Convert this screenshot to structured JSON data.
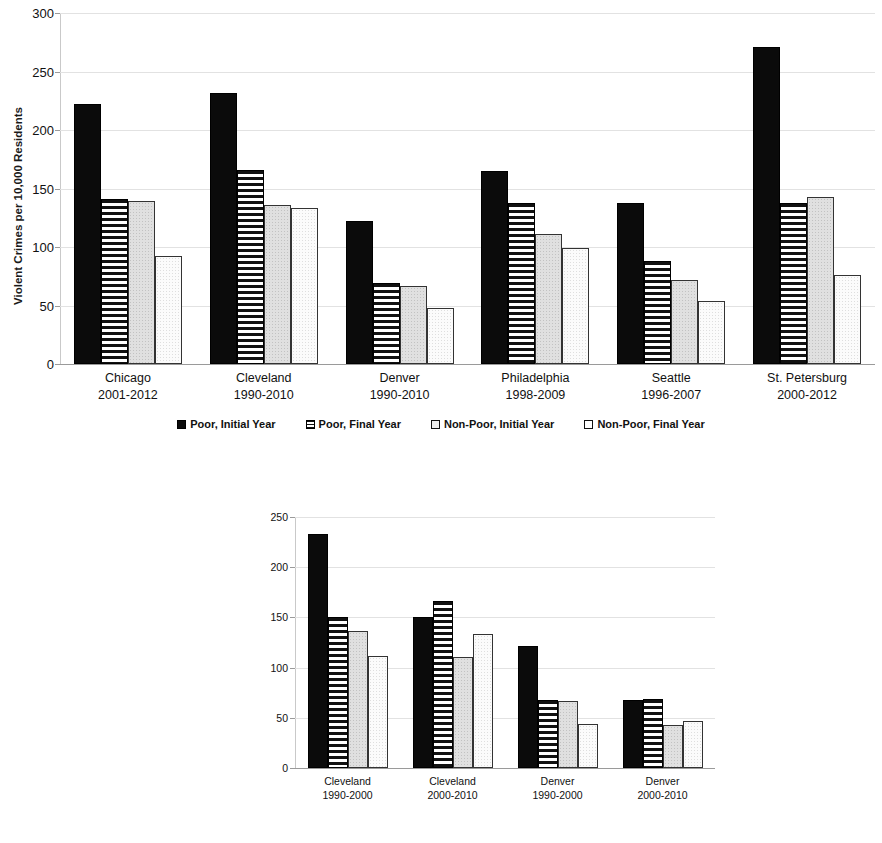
{
  "charts": [
    {
      "id": "top",
      "ylabel": "Violent Crimes per 10,000 Residents",
      "yticks": [
        "0",
        "50",
        "100",
        "150",
        "200",
        "250",
        "300"
      ],
      "categories": [
        {
          "name": "Chicago",
          "period": "2001-2012"
        },
        {
          "name": "Cleveland",
          "period": "1990-2010"
        },
        {
          "name": "Denver",
          "period": "1990-2010"
        },
        {
          "name": "Philadelphia",
          "period": "1998-2009"
        },
        {
          "name": "Seattle",
          "period": "1996-2007"
        },
        {
          "name": "St. Petersburg",
          "period": "2000-2012"
        }
      ],
      "legend": [
        {
          "label": "Poor, Initial Year",
          "swatch": "poor-initial"
        },
        {
          "label": "Poor, Final Year",
          "swatch": "poor-final"
        },
        {
          "label": "Non-Poor, Initial Year",
          "swatch": "nonpoor-initial"
        },
        {
          "label": "Non-Poor, Final Year",
          "swatch": "nonpoor-final"
        }
      ]
    },
    {
      "id": "bottom",
      "ylabel": "Violent Crimes per 10,000 Residents",
      "yticks": [
        "0",
        "50",
        "100",
        "150",
        "200",
        "250"
      ],
      "categories": [
        {
          "name": "Cleveland",
          "period": "1990-2000"
        },
        {
          "name": "Cleveland",
          "period": "2000-2010"
        },
        {
          "name": "Denver",
          "period": "1990-2000"
        },
        {
          "name": "Denver",
          "period": "2000-2010"
        }
      ],
      "legend": [
        {
          "label": "Poor, Initial Year",
          "swatch": "poor-initial"
        },
        {
          "label": "Poor, Final Year",
          "swatch": "poor-final"
        },
        {
          "label": "Non-Poor, Initial Year",
          "swatch": "nonpoor-initial"
        },
        {
          "label": "Non-Poor, Final Year",
          "swatch": "nonpoor-final"
        }
      ]
    }
  ],
  "chart_data": [
    {
      "type": "bar",
      "id": "top",
      "title": "",
      "xlabel": "",
      "ylabel": "Violent Crimes per 10,000 Residents",
      "ylim": [
        0,
        300
      ],
      "ytick_step": 50,
      "grid": true,
      "legend_position": "bottom",
      "categories": [
        "Chicago 2001-2012",
        "Cleveland 1990-2010",
        "Denver 1990-2010",
        "Philadelphia 1998-2009",
        "Seattle 1996-2007",
        "St. Petersburg 2000-2012"
      ],
      "series": [
        {
          "name": "Poor, Initial Year",
          "values": [
            222,
            232,
            122,
            165,
            138,
            271
          ]
        },
        {
          "name": "Poor, Final Year",
          "values": [
            141,
            166,
            69,
            138,
            88,
            138
          ]
        },
        {
          "name": "Non-Poor, Initial Year",
          "values": [
            139,
            136,
            67,
            111,
            72,
            143
          ]
        },
        {
          "name": "Non-Poor, Final Year",
          "values": [
            92,
            133,
            48,
            99,
            54,
            76
          ]
        }
      ]
    },
    {
      "type": "bar",
      "id": "bottom",
      "title": "",
      "xlabel": "",
      "ylabel": "Violent Crimes per 10,000 Residents",
      "ylim": [
        0,
        250
      ],
      "ytick_step": 50,
      "grid": true,
      "legend_position": "bottom",
      "categories": [
        "Cleveland 1990-2000",
        "Cleveland 2000-2010",
        "Denver 1990-2000",
        "Denver 2000-2010"
      ],
      "series": [
        {
          "name": "Poor, Initial Year",
          "values": [
            233,
            150,
            122,
            68
          ]
        },
        {
          "name": "Poor, Final Year",
          "values": [
            150,
            166,
            68,
            69
          ]
        },
        {
          "name": "Non-Poor, Initial Year",
          "values": [
            136,
            111,
            67,
            43
          ]
        },
        {
          "name": "Non-Poor, Final Year",
          "values": [
            112,
            133,
            44,
            47
          ]
        }
      ]
    }
  ]
}
